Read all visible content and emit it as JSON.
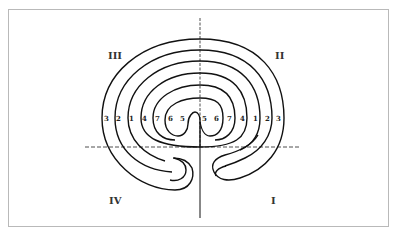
{
  "diagram": {
    "type": "classical seven-circuit labyrinth",
    "quadrants": {
      "bottom_right": "I",
      "top_right": "II",
      "top_left": "III",
      "bottom_left": "IV"
    },
    "circuit_numbers_left": [
      "3",
      "2",
      "1",
      "4",
      "7",
      "6",
      "5"
    ],
    "circuit_numbers_right": [
      "5",
      "6",
      "7",
      "4",
      "1",
      "2",
      "3"
    ],
    "colors": {
      "line": "#111111",
      "frame": "#b9b9b9",
      "background": "#ffffff"
    }
  }
}
